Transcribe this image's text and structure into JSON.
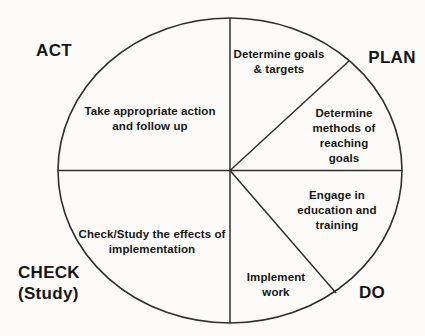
{
  "diagram": {
    "type": "PDCA cycle wheel",
    "colors": {
      "background": "#fcfbf9",
      "line": "#2f2f2f",
      "text": "#161616"
    }
  },
  "phases": {
    "act": "ACT",
    "plan": "PLAN",
    "check": "CHECK\n(Study)",
    "do": "DO"
  },
  "segments": {
    "determine_goals": "Determine goals\n& targets",
    "determine_methods": "Determine\nmethods of\nreaching goals",
    "engage_education": "Engage in\neducation and\ntraining",
    "implement_work": "Implement\nwork",
    "check_effects": "Check/Study the effects of\nimplementation",
    "take_action": "Take appropriate action\nand follow up"
  }
}
